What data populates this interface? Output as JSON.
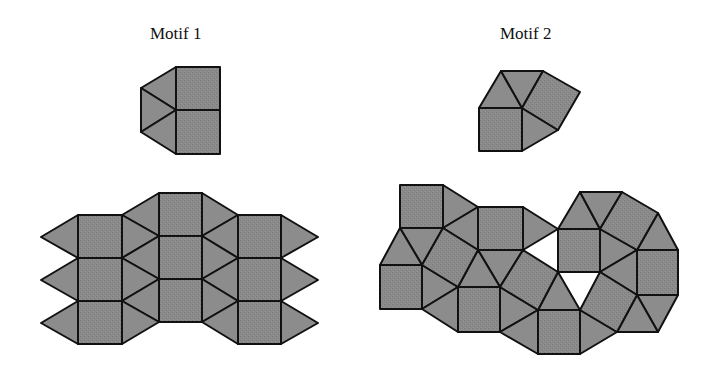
{
  "figure": {
    "panels": [
      {
        "title": "Motif 1",
        "motif": {
          "squares": 2,
          "triangles": 3
        },
        "tiling": {
          "squares": 9,
          "triangles": 18
        }
      },
      {
        "title": "Motif 2",
        "motif": {
          "squares": 2,
          "triangles": 3
        },
        "tiling": {
          "squares": 11,
          "triangles": 22
        }
      }
    ],
    "colors": {
      "square_fill": "#898989",
      "triangle_fill": "#8c8c8c",
      "stroke": "#111111"
    }
  }
}
